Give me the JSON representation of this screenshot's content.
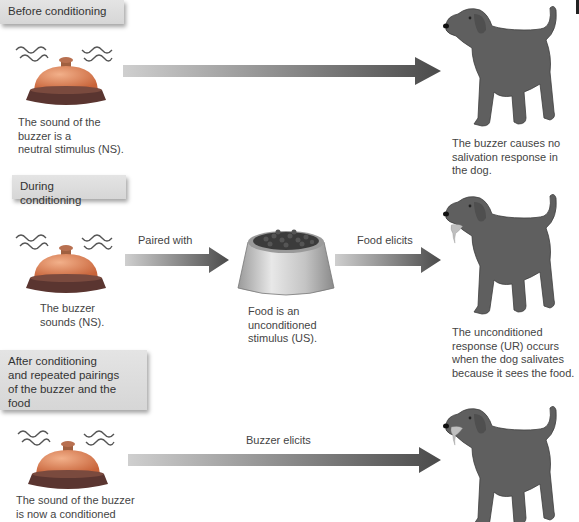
{
  "panels": [
    {
      "stage_label": "Before conditioning",
      "stimulus_caption": [
        "The sound of the",
        "buzzer is a",
        "neutral stimulus (NS)."
      ],
      "arrow_label": "",
      "response_caption": [
        "The buzzer causes no",
        "salivation response in",
        "the dog."
      ],
      "dog_salivating": false
    },
    {
      "stage_label": "During conditioning",
      "stimulus_caption": [
        "The buzzer",
        "sounds (NS)."
      ],
      "arrow1_label": "Paired with",
      "food_caption": [
        "Food is an",
        "unconditioned",
        "stimulus (US)."
      ],
      "arrow2_label": "Food elicits",
      "response_caption": [
        "The unconditioned",
        "response (UR) occurs",
        "when the dog salivates",
        "because it sees the food."
      ],
      "dog_salivating": true
    },
    {
      "stage_label": [
        "After conditioning",
        "and repeated pairings",
        "of the buzzer and the food"
      ],
      "stimulus_caption": [
        "The sound of the buzzer",
        "is now a conditioned"
      ],
      "arrow_label": "Buzzer elicits",
      "dog_salivating": true
    }
  ],
  "icons": {
    "bell": "buzzer-bell-icon",
    "bowl": "food-bowl-icon",
    "dog": "dog-illustration",
    "arrow": "gradient-arrow-icon"
  },
  "colors": {
    "label_box": "#dcdcdc",
    "bell_dome": "#e08a5a",
    "bell_base": "#5a3530",
    "dog": "#5e5e5e",
    "arrow_start": "#c8c8c8",
    "arrow_end": "#4a4a4a"
  }
}
